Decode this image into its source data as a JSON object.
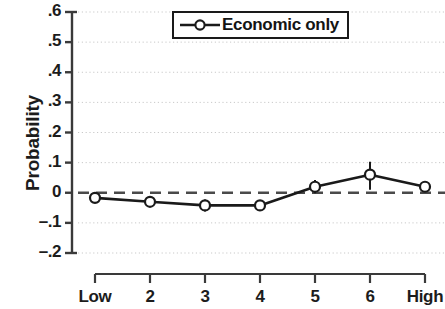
{
  "chart_data": {
    "type": "line",
    "title": "",
    "subtitle": "",
    "xlabel": "",
    "ylabel": "Probability",
    "categories": [
      "Low",
      "2",
      "3",
      "4",
      "5",
      "6",
      "High"
    ],
    "series": [
      {
        "name": "Economic only",
        "values": [
          -0.017,
          -0.03,
          -0.042,
          -0.042,
          0.02,
          0.06,
          0.02
        ],
        "error_low": [
          -0.03,
          -0.047,
          -0.062,
          -0.06,
          -0.002,
          0.01,
          0.01
        ],
        "error_high": [
          -0.005,
          -0.014,
          -0.022,
          -0.024,
          0.042,
          0.103,
          0.03
        ],
        "marker": "open-circle",
        "color": "#1a1a1a"
      }
    ],
    "ylim": [
      -0.2,
      0.6
    ],
    "yticks": [
      0.6,
      0.5,
      0.4,
      0.3,
      0.2,
      0.1,
      0.0,
      -0.1,
      -0.2
    ],
    "ytick_labels": [
      ".6",
      ".5",
      ".4",
      ".3",
      ".2",
      ".1",
      "0",
      "–.1",
      "–.2"
    ],
    "xtick_labels": [
      "Low",
      "2",
      "3",
      "4",
      "5",
      "6",
      "High"
    ],
    "grid": "horizontal-dotted",
    "grid_color": "#c9c9c9",
    "reference_line": {
      "value": 0,
      "style": "dashed",
      "color": "#4a4a4a"
    },
    "legend": {
      "position": "top-center",
      "entries": [
        {
          "label": "Economic only",
          "marker": "open-circle",
          "color": "#1a1a1a"
        }
      ]
    },
    "axis_color": "#3a3a3a",
    "background": "#ffffff"
  },
  "legend": {
    "entry_label": "Economic only"
  },
  "axes": {
    "y_title": "Probability"
  }
}
